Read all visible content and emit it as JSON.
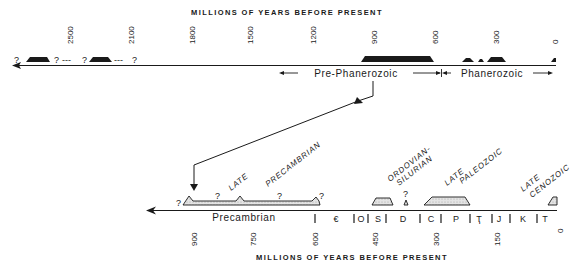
{
  "top_axis": {
    "title": "MILLIONS OF YEARS BEFORE PRESENT",
    "ticks": [
      "2500",
      "2100",
      "1800",
      "1500",
      "1200",
      "900",
      "600",
      "300",
      "0"
    ],
    "eon_labels": {
      "pre_phanerozoic": "Pre-Phanerozoic",
      "phanerozoic": "Phanerozoic"
    },
    "question_marks": [
      "?",
      "?",
      "?",
      "?"
    ],
    "dashes": [
      "---",
      "---"
    ]
  },
  "bottom_axis": {
    "title": "MILLIONS OF YEARS BEFORE PRESENT",
    "ticks": [
      "900",
      "750",
      "600",
      "450",
      "300",
      "150",
      "0"
    ],
    "precambrian_label": "Precambrian",
    "periods": [
      "€",
      "O",
      "S",
      "D",
      "C",
      "P",
      "Ҭ",
      "J",
      "K",
      "T"
    ],
    "glaciation_labels": {
      "late_precambrian_1": "LATE",
      "late_precambrian_2": "PRECAMBRIAN",
      "ordovician_silurian_1": "ORDOVIAN-",
      "ordovician_silurian_2": "SILURIAN",
      "late_paleozoic_1": "LATE",
      "late_paleozoic_2": "PALEOZOIC",
      "late_cenozoic_1": "LATE",
      "late_cenozoic_2": "CENOZOIC"
    },
    "question_marks": [
      "?",
      "?",
      "?",
      "?",
      "?"
    ]
  },
  "colors": {
    "ink": "#1a1a1a",
    "fill_light": "#d9d9d9",
    "background": "#ffffff"
  }
}
